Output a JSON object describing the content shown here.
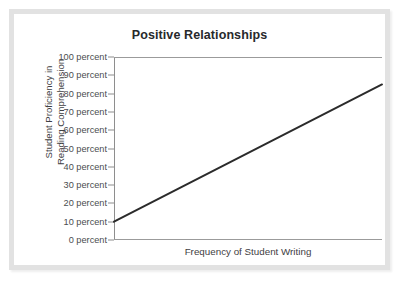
{
  "figure": {
    "title": "Positive Relationships",
    "frame_color": "#e2e2e2",
    "background": "#ffffff"
  },
  "chart_data": {
    "type": "line",
    "title": "Positive Relationships",
    "xlabel": "Frequency of Student Writing",
    "ylabel_line1": "Student Proficiency in",
    "ylabel_line2": "Reading Comprehension",
    "ylabel": "Student Proficiency in Reading Comprehension",
    "grid": false,
    "legend": "none",
    "axis_color": "#9b9b9b",
    "line_color": "#2b2b2b",
    "line_width": 2,
    "ylim": [
      0,
      100
    ],
    "ytick_labels": [
      "100 percent",
      "90 percent",
      "80 percent",
      "70 percent",
      "60 percent",
      "50 percent",
      "40 percent",
      "30 percent",
      "20 percent",
      "10 percent",
      "0 percent"
    ],
    "ytick_values": [
      100,
      90,
      80,
      70,
      60,
      50,
      40,
      30,
      20,
      10,
      0
    ],
    "xtick_labels": [],
    "xlim": [
      0,
      100
    ],
    "series": [
      {
        "name": "Positive relationship trend",
        "x": [
          0,
          100
        ],
        "values": [
          10,
          85
        ]
      }
    ]
  }
}
